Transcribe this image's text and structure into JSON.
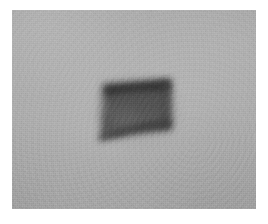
{
  "image": {
    "kind": "photograph",
    "subject_name": "dark-quadrilateral-object",
    "description": "Blurry low-resolution grayscale photograph of a dark flag-like quadrilateral object centered on a flat, noisy gray background",
    "color_mode": "grayscale",
    "width_px": 268,
    "height_px": 224,
    "caption": ""
  },
  "frame": {
    "page_background": "#ffffff",
    "plate_left_px": 12,
    "plate_top_px": 10,
    "plate_width_px": 244,
    "plate_height_px": 199
  },
  "background": {
    "name": "flat-gray-field",
    "base_color": "#a9a9a9",
    "highlight_color": "#b4b4b4",
    "shadow_color": "#9d9d9d",
    "texture": "fine-grain-noise",
    "noise_opacity": 0.42
  },
  "subject": {
    "name": "dark-quadrilateral-object",
    "shape": "quadrilateral-with-lower-left-tail",
    "fill_color": "#5a5a5a",
    "core_color": "#4e4e4e",
    "edge_color": "#343434",
    "top_edge_color": "#323232",
    "blur_radius_px": 5,
    "bounds": {
      "left_px": 91,
      "top_px": 72,
      "right_px": 159,
      "bottom_px": 128
    },
    "outline_points": "91,74 158,70 159,119 99,127 87,128 92,112",
    "top_edge_points": "91,76 158,71",
    "bottom_curve": "M 88,128 C 96,120 116,115 140,112 L 159,110"
  },
  "labels": {
    "none_visible": true
  }
}
